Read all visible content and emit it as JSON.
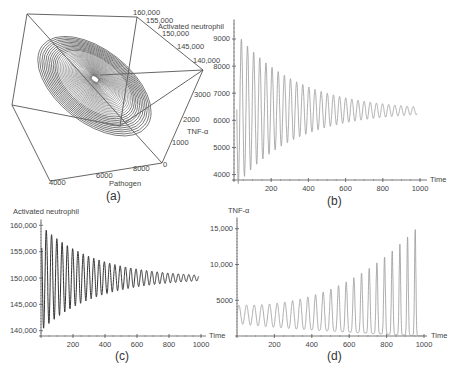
{
  "figure": {
    "panels": [
      "(a)",
      "(b)",
      "(c)",
      "(d)"
    ]
  },
  "chart_data": [
    {
      "id": "a",
      "type": "line3d",
      "panel_label": "(a)",
      "title": "",
      "axes": {
        "x": {
          "label": "Pathogen",
          "ticks": [
            "4000",
            "6000",
            "8000"
          ]
        },
        "y": {
          "label": "Activated neutrophil",
          "ticks": [
            "140,000",
            "145,000",
            "150,000",
            "155,000",
            "160,000"
          ]
        },
        "z": {
          "label": "TNF-α",
          "ticks": [
            "0",
            "1000",
            "2000",
            "3000"
          ]
        }
      },
      "description": "Phase-space trajectory spiralling inward to a stable point (damped oscillation), drawn inside a 3D bounding box",
      "color": "#555555"
    },
    {
      "id": "b",
      "type": "line",
      "panel_label": "(b)",
      "xlabel": "Time",
      "ylabel": "",
      "xlim": [
        0,
        1000
      ],
      "ylim": [
        3800,
        9700
      ],
      "xticks": [
        "200",
        "400",
        "600",
        "800",
        "1000"
      ],
      "yticks": [
        "4000",
        "5000",
        "6000",
        "7000",
        "8000",
        "9000"
      ],
      "series": [
        {
          "name": "Pathogen",
          "color": "#999999",
          "oscillation": {
            "period": 33,
            "center_start": 6400,
            "center_end": 6350,
            "amp_start": 2800,
            "amp_end": 150,
            "decay": "exponential"
          }
        }
      ],
      "peaks_approx": {
        "x": [
          40,
          73,
          106,
          139,
          172,
          205,
          238,
          271,
          304,
          337,
          370,
          403,
          436,
          469,
          502,
          535,
          568,
          601,
          634,
          667,
          700,
          733,
          766,
          799,
          832,
          865,
          898,
          931,
          964
        ],
        "y": [
          9600,
          9200,
          8900,
          8650,
          8400,
          8150,
          7900,
          7750,
          7600,
          7450,
          7350,
          7200,
          7100,
          7000,
          6950,
          6850,
          6800,
          6750,
          6700,
          6650,
          6600,
          6580,
          6560,
          6540,
          6520,
          6510,
          6500,
          6490,
          6480
        ]
      }
    },
    {
      "id": "c",
      "type": "line",
      "panel_label": "(c)",
      "xlabel": "Time",
      "ylabel": "Activated neutrophil",
      "xlim": [
        0,
        1000
      ],
      "ylim": [
        139000,
        161000
      ],
      "xticks": [
        "200",
        "400",
        "600",
        "800",
        "1000"
      ],
      "yticks": [
        "140,000",
        "145,000",
        "150,000",
        "155,000",
        "160,000"
      ],
      "series": [
        {
          "name": "Activated neutrophil",
          "color": "#333333",
          "oscillation": {
            "period": 33,
            "center": 150000,
            "amp_start": 10000,
            "amp_end": 600,
            "decay": "exponential"
          }
        }
      ]
    },
    {
      "id": "d",
      "type": "line",
      "panel_label": "(d)",
      "xlabel": "Time",
      "ylabel": "TNF-α",
      "xlim": [
        0,
        1000
      ],
      "ylim": [
        0,
        16500
      ],
      "xticks": [
        "200",
        "400",
        "600",
        "800",
        "1000"
      ],
      "yticks": [
        "5000",
        "10,000",
        "15,000"
      ],
      "series": [
        {
          "name": "TNF-α",
          "color": "#999999",
          "oscillation": {
            "period": 41,
            "baseline_start": 1800,
            "baseline_end": 0,
            "peak_start": 4300,
            "peak_end": 16200,
            "growth": "exponential"
          }
        }
      ],
      "peaks_approx": {
        "x": [
          10,
          55,
          96,
          137,
          178,
          219,
          260,
          301,
          342,
          383,
          424,
          465,
          506,
          547,
          588,
          629,
          670,
          711,
          752,
          793,
          834,
          875,
          916,
          957
        ],
        "y": [
          4300,
          3900,
          3950,
          4000,
          4050,
          4150,
          4300,
          4450,
          4650,
          4850,
          5100,
          5350,
          5650,
          5950,
          6300,
          6700,
          7200,
          7900,
          8700,
          9700,
          10900,
          12300,
          14000,
          16200
        ]
      }
    }
  ]
}
